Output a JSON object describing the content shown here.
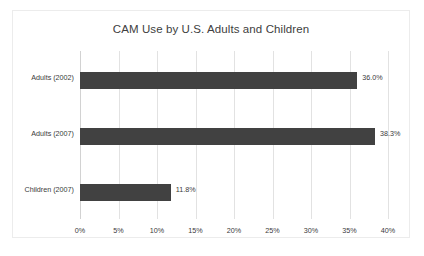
{
  "chart_data": {
    "type": "bar",
    "orientation": "horizontal",
    "title": "CAM Use by U.S. Adults and Children",
    "xlabel": "",
    "ylabel": "",
    "categories": [
      "Adults (2002)",
      "Adults (2007)",
      "Children (2007)"
    ],
    "values": [
      36.0,
      38.3,
      11.8
    ],
    "data_labels": [
      "36.0%",
      "38.3%",
      "11.8%"
    ],
    "xlim": [
      0,
      40
    ],
    "xtick_values": [
      0,
      5,
      10,
      15,
      20,
      25,
      30,
      35,
      40
    ],
    "xtick_labels": [
      "0%",
      "5%",
      "10%",
      "15%",
      "20%",
      "25%",
      "30%",
      "35%",
      "40%"
    ],
    "grid": "vertical",
    "legend": "none",
    "series_color": "#414141",
    "title_color": "#404040",
    "gridline_color": "#e2e2e2",
    "frame_color": "#ececec"
  }
}
